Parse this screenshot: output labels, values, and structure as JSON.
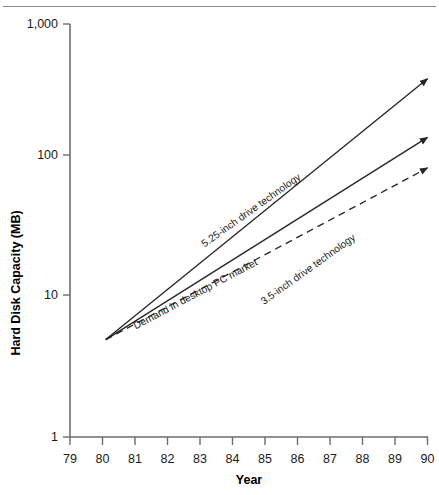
{
  "chart_data": {
    "type": "line",
    "title": "",
    "xlabel": "Year",
    "ylabel": "Hard Disk Capacity (MB)",
    "yscale": "log",
    "ylim": [
      1,
      1000
    ],
    "xlim": [
      79,
      90
    ],
    "grid": false,
    "legend_position": "inline-labels",
    "y_ticks": [
      "1,000",
      "100",
      "10",
      "1"
    ],
    "y_tick_values": [
      1000,
      100,
      10,
      1
    ],
    "x_ticks": [
      "79",
      "80",
      "81",
      "82",
      "83",
      "84",
      "85",
      "86",
      "87",
      "88",
      "89",
      "90"
    ],
    "x_tick_values": [
      79,
      80,
      81,
      82,
      83,
      84,
      85,
      86,
      87,
      88,
      89,
      90
    ],
    "series": [
      {
        "name": "5.25-inch drive technology",
        "style": "solid",
        "arrow_end": true,
        "x": [
          80.1,
          90.0
        ],
        "values": [
          5.1,
          400.0
        ],
        "label_text": "5.25-inch drive technology",
        "label_x": 253,
        "label_y": 213,
        "label_rotation": -35.5
      },
      {
        "name": "3.5-inch drive technology",
        "style": "solid",
        "arrow_end": true,
        "x": [
          80.1,
          90.0
        ],
        "values": [
          5.1,
          150.0
        ],
        "label_text": "3.5-inch drive technology",
        "label_x": 310,
        "label_y": 272,
        "label_rotation": -35.5
      },
      {
        "name": "Demand in desktop PC market",
        "style": "dashed",
        "arrow_end": true,
        "x": [
          80.1,
          90.0
        ],
        "values": [
          5.1,
          90.0
        ],
        "label_text": "Demand in desktop PC market",
        "label_x": 197,
        "label_y": 297,
        "label_rotation": -28.0
      }
    ]
  },
  "figure": {
    "background_color": "#ffffff",
    "line_color": "#262626",
    "axis_color": "#6d6d6d",
    "rule_color": "#8a8a8a"
  }
}
